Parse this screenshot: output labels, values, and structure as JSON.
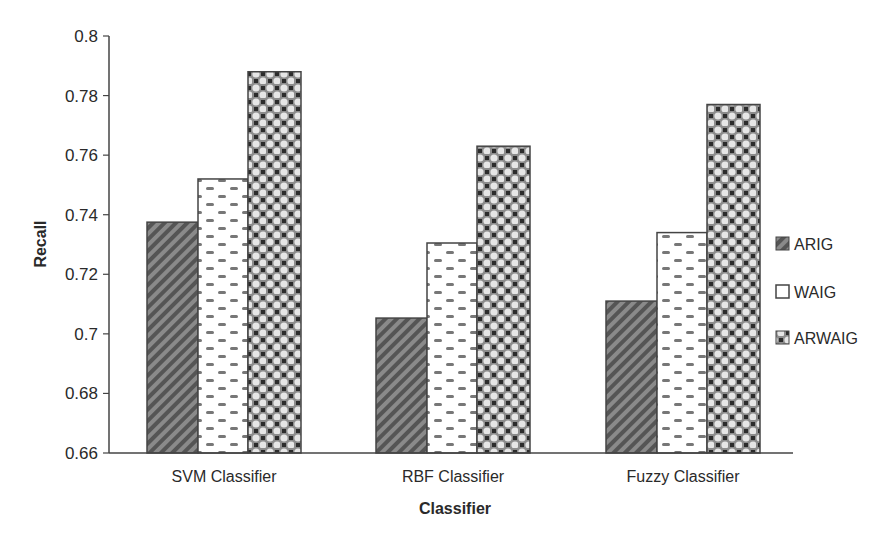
{
  "chart_data": {
    "type": "bar",
    "title": "",
    "xlabel": "Classifier",
    "ylabel": "Recall",
    "ylim": [
      0.66,
      0.8
    ],
    "yticks": [
      "0.66",
      "0.68",
      "0.7",
      "0.72",
      "0.74",
      "0.76",
      "0.78",
      "0.8"
    ],
    "grid": false,
    "legend_position": "right",
    "categories": [
      "SVM Classifier",
      "RBF Classifier",
      "Fuzzy Classifier"
    ],
    "series": [
      {
        "name": "ARIG",
        "values": [
          0.7375,
          0.7053,
          0.711
        ],
        "pattern": "diagonal-stripes"
      },
      {
        "name": "WAIG",
        "values": [
          0.752,
          0.7305,
          0.734
        ],
        "pattern": "dashes"
      },
      {
        "name": "ARWAIG",
        "values": [
          0.788,
          0.763,
          0.777
        ],
        "pattern": "circles-checker"
      }
    ]
  },
  "legend": {
    "items": [
      "ARIG",
      "WAIG",
      "ARWAIG"
    ]
  }
}
